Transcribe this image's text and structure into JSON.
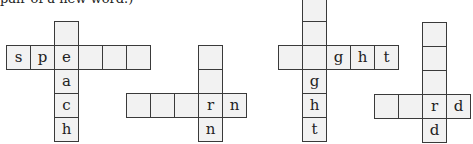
{
  "caption": "pair of a new word.)",
  "puzzles": [
    {
      "name": "speach",
      "cells": [
        {
          "x": 54,
          "y": 21,
          "letter": ""
        },
        {
          "x": 6,
          "y": 45,
          "letter": "s"
        },
        {
          "x": 30,
          "y": 45,
          "letter": "p"
        },
        {
          "x": 54,
          "y": 45,
          "letter": "e"
        },
        {
          "x": 78,
          "y": 45,
          "letter": ""
        },
        {
          "x": 102,
          "y": 45,
          "letter": ""
        },
        {
          "x": 126,
          "y": 45,
          "letter": ""
        },
        {
          "x": 54,
          "y": 69,
          "letter": "a"
        },
        {
          "x": 54,
          "y": 93,
          "letter": "c"
        },
        {
          "x": 54,
          "y": 117,
          "letter": "h"
        }
      ]
    },
    {
      "name": "rn",
      "cells": [
        {
          "x": 198,
          "y": 45,
          "letter": ""
        },
        {
          "x": 198,
          "y": 69,
          "letter": ""
        },
        {
          "x": 126,
          "y": 93,
          "letter": ""
        },
        {
          "x": 150,
          "y": 93,
          "letter": ""
        },
        {
          "x": 174,
          "y": 93,
          "letter": ""
        },
        {
          "x": 198,
          "y": 93,
          "letter": "r"
        },
        {
          "x": 222,
          "y": 93,
          "letter": "n"
        },
        {
          "x": 198,
          "y": 117,
          "letter": "n"
        }
      ]
    },
    {
      "name": "ght",
      "cells": [
        {
          "x": 302,
          "y": -3,
          "letter": ""
        },
        {
          "x": 302,
          "y": 21,
          "letter": ""
        },
        {
          "x": 278,
          "y": 45,
          "letter": ""
        },
        {
          "x": 302,
          "y": 45,
          "letter": ""
        },
        {
          "x": 326,
          "y": 45,
          "letter": "g"
        },
        {
          "x": 350,
          "y": 45,
          "letter": "h"
        },
        {
          "x": 374,
          "y": 45,
          "letter": "t"
        },
        {
          "x": 302,
          "y": 69,
          "letter": "g"
        },
        {
          "x": 302,
          "y": 93,
          "letter": "h"
        },
        {
          "x": 302,
          "y": 117,
          "letter": "t"
        }
      ]
    },
    {
      "name": "rd",
      "cells": [
        {
          "x": 422,
          "y": 22,
          "letter": ""
        },
        {
          "x": 422,
          "y": 46,
          "letter": ""
        },
        {
          "x": 422,
          "y": 70,
          "letter": ""
        },
        {
          "x": 374,
          "y": 94,
          "letter": ""
        },
        {
          "x": 398,
          "y": 94,
          "letter": ""
        },
        {
          "x": 422,
          "y": 94,
          "letter": "r"
        },
        {
          "x": 446,
          "y": 94,
          "letter": "d"
        },
        {
          "x": 422,
          "y": 118,
          "letter": "d"
        }
      ]
    }
  ]
}
